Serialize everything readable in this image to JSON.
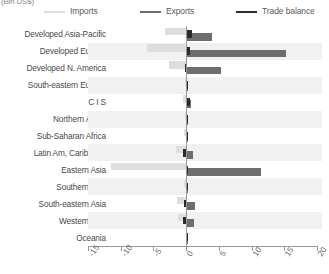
{
  "units_label": "(Bln US$)",
  "legend": {
    "entries": [
      {
        "label": "Imports",
        "color": "#dedede",
        "icon": "line-swatch"
      },
      {
        "label": "Exports",
        "color": "#6e6e6e",
        "icon": "line-swatch"
      },
      {
        "label": "Trade balance",
        "color": "#2b2b2b",
        "icon": "line-swatch"
      }
    ]
  },
  "chart_data": {
    "type": "bar",
    "orientation": "horizontal",
    "title": "",
    "subtitle": "",
    "xlabel": "(Bln US$)",
    "ylabel": "",
    "xlim": [
      -15,
      20
    ],
    "xticks": [
      -15,
      -10,
      -5,
      0,
      5,
      10,
      15,
      20
    ],
    "xticklabels": [
      "-15",
      "-10",
      "-5",
      "0",
      "5",
      "10",
      "15",
      "20"
    ],
    "grid": false,
    "zero_reference_line": true,
    "legend_position": "top",
    "categories": [
      "Developed Asia-Pacific",
      "Developed Europe",
      "Developed N. America",
      "South-eastern Europe",
      "C I S",
      "Northern Africa",
      "Sub-Saharan Africa",
      "Latin Am, Caribbean",
      "Eastern Asia",
      "Southern Asia",
      "South-eastern Asia",
      "Western Asia",
      "Oceania"
    ],
    "series": [
      {
        "name": "Imports",
        "color": "#dedede",
        "values": [
          -3.2,
          -6.0,
          -2.6,
          -0.1,
          -0.5,
          -0.2,
          -0.3,
          -1.5,
          -11.5,
          -0.3,
          -1.4,
          -1.3,
          -0.05
        ]
      },
      {
        "name": "Exports",
        "color": "#6e6e6e",
        "values": [
          3.9,
          15.2,
          5.3,
          0.1,
          0.7,
          0.3,
          0.2,
          1.1,
          11.4,
          0.3,
          1.3,
          1.2,
          0.05
        ]
      },
      {
        "name": "Trade balance",
        "color": "#2b2b2b",
        "values": [
          0.9,
          0.6,
          -0.2,
          0.05,
          0.6,
          0.3,
          0.1,
          -0.5,
          0.2,
          0.1,
          -0.4,
          -0.5,
          0.02
        ]
      }
    ]
  }
}
